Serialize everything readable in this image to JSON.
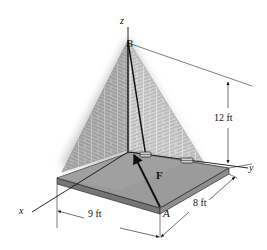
{
  "figure": {
    "background_color": "#ffffff",
    "axes": {
      "z_label": "z",
      "y_label": "y",
      "x_label": "x"
    },
    "points": {
      "apex_label": "B",
      "corner_label": "A"
    },
    "force": {
      "label": "F",
      "description": "force vector from A toward B"
    },
    "dimensions": {
      "height": "12 ft",
      "width_x": "9 ft",
      "width_y": "8 ft"
    },
    "colors": {
      "slab_top": "#9a9a9a",
      "slab_front_edge": "#6d6d6d",
      "slab_side_edge": "#8a8a8a",
      "brick_face_light": "#b6b6b6",
      "brick_face_dark": "#9d9d9d",
      "brick_mortar": "#d6d6d6",
      "line": "#111111",
      "shadow": "#c8c8c8"
    },
    "hardware": {
      "bracket_count": 2,
      "bracket_label": "cable bracket"
    }
  }
}
